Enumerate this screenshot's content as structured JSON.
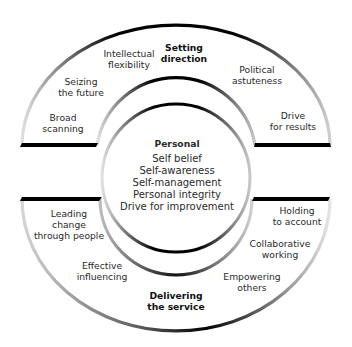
{
  "diagram": {
    "type": "leadership-framework-rings",
    "sections": {
      "setting_direction": {
        "title_line1": "Setting",
        "title_line2": "direction",
        "items": [
          {
            "line1": "Intellectual",
            "line2": "flexibility"
          },
          {
            "line1": "Seizing",
            "line2": "the future"
          },
          {
            "line1": "Broad",
            "line2": "scanning"
          },
          {
            "line1": "Political",
            "line2": "astuteness"
          },
          {
            "line1": "Drive",
            "line2": "for results"
          }
        ]
      },
      "personal": {
        "title": "Personal",
        "items": [
          "Self belief",
          "Self-awareness",
          "Self-management",
          "Personal integrity",
          "Drive for improvement"
        ]
      },
      "delivering_service": {
        "title_line1": "Delivering",
        "title_line2": "the service",
        "items": [
          {
            "line1": "Leading",
            "line2": "change",
            "line3": "through people"
          },
          {
            "line1": "Effective",
            "line2": "influencing"
          },
          {
            "line1": "Holding",
            "line2": "to account"
          },
          {
            "line1": "Collaborative",
            "line2": "working"
          },
          {
            "line1": "Empowering",
            "line2": "others"
          }
        ]
      }
    },
    "colors": {
      "stroke_dark": "#000000",
      "stroke_light": "#d0d0d0",
      "background": "#ffffff"
    }
  }
}
